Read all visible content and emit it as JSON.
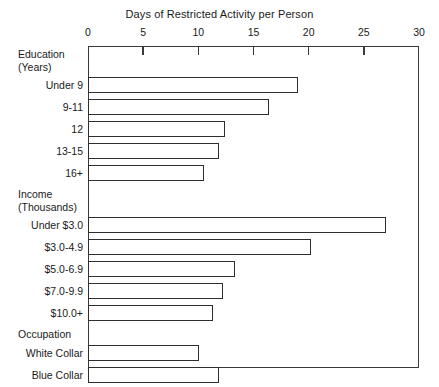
{
  "chart_data": {
    "type": "bar",
    "orientation": "horizontal",
    "title": "Days of Restricted Activity per Person",
    "xlabel": "",
    "ylabel": "",
    "xlim": [
      0,
      30
    ],
    "xticks": [
      0,
      5,
      10,
      15,
      20,
      25,
      30
    ],
    "grid": false,
    "legend": null,
    "groups": [
      {
        "name": "Education",
        "unit_label": "(Years)",
        "categories": [
          "Under 9",
          "9-11",
          "12",
          "13-15",
          "16+"
        ],
        "values": [
          19.0,
          16.4,
          12.4,
          11.9,
          10.5
        ]
      },
      {
        "name": "Income",
        "unit_label": "(Thousands)",
        "categories": [
          "Under $3.0",
          "$3.0-4.9",
          "$5.0-6.9",
          "$7.0-9.9",
          "$10.0+"
        ],
        "values": [
          27.0,
          20.2,
          13.3,
          12.2,
          11.3
        ]
      },
      {
        "name": "Occupation",
        "unit_label": "",
        "categories": [
          "White Collar",
          "Blue Collar",
          "Service",
          "Farm"
        ],
        "values": [
          10.1,
          11.9,
          12.2,
          11.5
        ]
      }
    ],
    "categories": [
      "Under 9",
      "9-11",
      "12",
      "13-15",
      "16+",
      "Under $3.0",
      "$3.0-4.9",
      "$5.0-6.9",
      "$7.0-9.9",
      "$10.0+",
      "White Collar",
      "Blue Collar",
      "Service",
      "Farm"
    ],
    "values": [
      19.0,
      16.4,
      12.4,
      11.9,
      10.5,
      27.0,
      20.2,
      13.3,
      12.2,
      11.3,
      10.1,
      11.9,
      12.2,
      11.5
    ],
    "colors": {
      "bar_fill": "#ffffff",
      "bar_stroke": "#2e2e2e",
      "axis": "#3a3a3a",
      "text": "#1a1a1a",
      "background": "#ffffff"
    }
  }
}
